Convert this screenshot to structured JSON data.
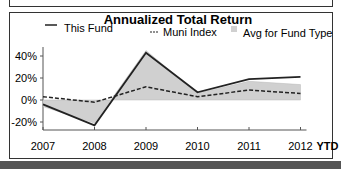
{
  "chart_data": {
    "type": "line",
    "title": "Annualized Total Return",
    "xlabel": "",
    "ylabel": "",
    "categories": [
      "2007",
      "2008",
      "2009",
      "2010",
      "2011",
      "2012"
    ],
    "x_suffix_label": "YTD",
    "ylim": [
      -25,
      50
    ],
    "yticks": [
      "40%",
      "20%",
      "0%",
      "-20%"
    ],
    "grid": false,
    "legend_position": "top",
    "series": [
      {
        "name": "This Fund",
        "style": "solid",
        "values": [
          -4,
          -23,
          43,
          7,
          19,
          21
        ]
      },
      {
        "name": "Muni Index",
        "style": "dashed",
        "values": [
          3,
          -2,
          12,
          3,
          9,
          6
        ]
      },
      {
        "name": "Avg for Fund Type",
        "style": "area",
        "values": [
          -6,
          -21,
          45,
          6,
          17,
          14
        ]
      }
    ]
  },
  "legend": {
    "fund": "This Fund",
    "index": "Muni Index",
    "avg": "Avg for Fund Type"
  },
  "colors": {
    "fund": "#222222",
    "index": "#222222",
    "avg": "#d0d0d0"
  }
}
